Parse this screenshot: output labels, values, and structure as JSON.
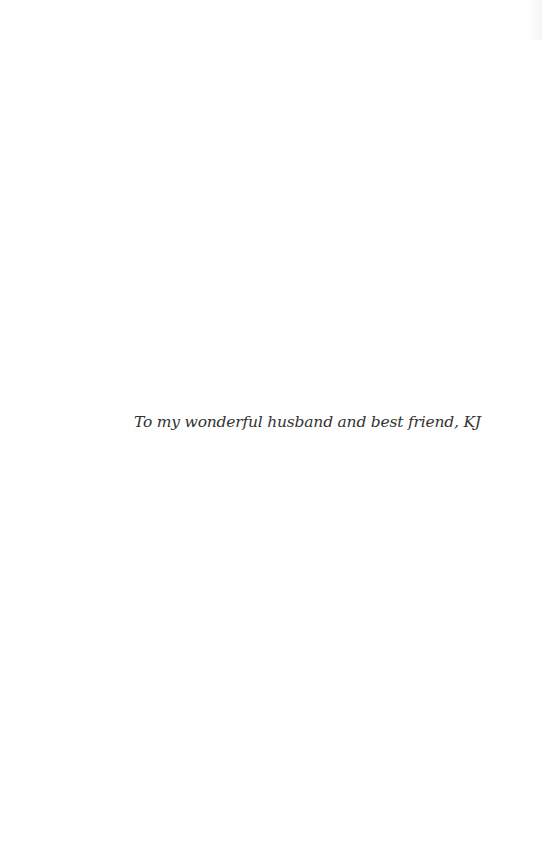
{
  "page": {
    "background": "#fefefe",
    "text_color": "#333333"
  },
  "dedication": {
    "text": "To my wonderful husband and best friend, KJ"
  }
}
